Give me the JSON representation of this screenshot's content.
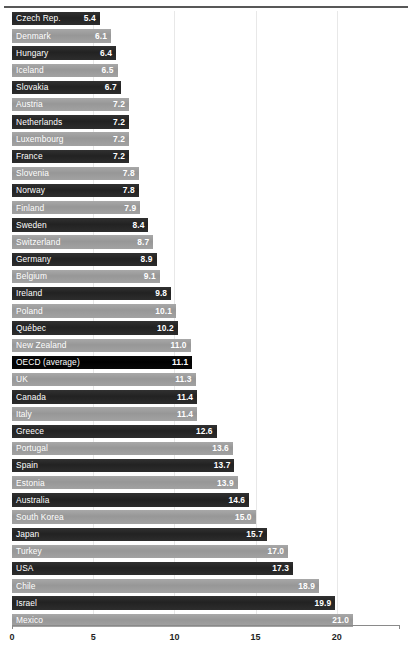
{
  "chart_data": {
    "type": "bar",
    "orientation": "horizontal",
    "title": "",
    "xlabel": "",
    "ylabel": "",
    "xlim": [
      0,
      24
    ],
    "grid": true,
    "legend": false,
    "xticks": [
      0,
      5,
      10,
      15,
      20
    ],
    "xtick_labels": [
      "0",
      "5",
      "10",
      "15",
      "20"
    ],
    "highlight_category": "OECD (average)",
    "categories": [
      "Czech Rep.",
      "Denmark",
      "Hungary",
      "Iceland",
      "Slovakia",
      "Austria",
      "Netherlands",
      "Luxembourg",
      "France",
      "Slovenia",
      "Norway",
      "Finland",
      "Sweden",
      "Switzerland",
      "Germany",
      "Belgium",
      "Ireland",
      "Poland",
      "Québec",
      "New Zealand",
      "OECD (average)",
      "UK",
      "Canada",
      "Italy",
      "Greece",
      "Portugal",
      "Spain",
      "Estonia",
      "Australia",
      "South Korea",
      "Japan",
      "Turkey",
      "USA",
      "Chile",
      "Israel",
      "Mexico"
    ],
    "values": [
      5.4,
      6.1,
      6.4,
      6.5,
      6.7,
      7.2,
      7.2,
      7.2,
      7.2,
      7.8,
      7.8,
      7.9,
      8.4,
      8.7,
      8.9,
      9.1,
      9.8,
      10.1,
      10.2,
      11.0,
      11.1,
      11.3,
      11.4,
      11.4,
      12.6,
      13.6,
      13.7,
      13.9,
      14.6,
      15.0,
      15.7,
      17.0,
      17.3,
      18.9,
      19.9,
      21.0
    ],
    "value_labels": [
      "5.4",
      "6.1",
      "6.4",
      "6.5",
      "6.7",
      "7.2",
      "7.2",
      "7.2",
      "7.2",
      "7.8",
      "7.8",
      "7.9",
      "8.4",
      "8.7",
      "8.9",
      "9.1",
      "9.8",
      "10.1",
      "10.2",
      "11.0",
      "11.1",
      "11.3",
      "11.4",
      "11.4",
      "12.6",
      "13.6",
      "13.7",
      "13.9",
      "14.6",
      "15.0",
      "15.7",
      "17.0",
      "17.3",
      "18.9",
      "19.9",
      "21.0"
    ]
  },
  "colors": {
    "bar_dark": "#272727",
    "bar_light": "#9d9d9d",
    "bar_highlight": "#000000",
    "label_text": "#ffffff",
    "axis": "#8a8a8a",
    "grid": "#e8e8e8",
    "background": "#ffffff"
  }
}
